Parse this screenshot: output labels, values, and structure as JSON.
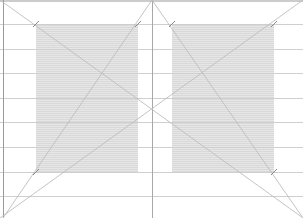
{
  "diagram": {
    "width": 303,
    "height": 218,
    "colors": {
      "background": "#ffffff",
      "text_block": "#e6e6e6",
      "text_block_lines": "#d9d9d9",
      "grid_line": "#cfcfcf",
      "diagonal": "#bdbdbd",
      "spine": "#a8a8a8",
      "edge": "#9a9a9a",
      "tick": "#8a8a8a"
    },
    "page_edges": {
      "left_edge_x": 3,
      "spine_x": 152,
      "top_y": 1
    },
    "horizontal_guides_y": [
      24,
      49,
      73,
      98,
      122,
      147,
      172,
      196
    ],
    "text_blocks": [
      {
        "name": "left-text-block",
        "x": 36,
        "y": 24,
        "w": 102,
        "h": 148
      },
      {
        "name": "right-text-block",
        "x": 172,
        "y": 24,
        "w": 102,
        "h": 148
      }
    ],
    "diagonals": [
      {
        "name": "spread-diagonal-descending",
        "x1": 0,
        "y1": 0,
        "x2": 303,
        "y2": 218
      },
      {
        "name": "spread-diagonal-ascending",
        "x1": 0,
        "y1": 218,
        "x2": 303,
        "y2": 0
      },
      {
        "name": "left-page-diagonal",
        "x1": 152,
        "y1": 0,
        "x2": 3,
        "y2": 218
      },
      {
        "name": "right-page-diagonal",
        "x1": 152,
        "y1": 0,
        "x2": 303,
        "y2": 218
      }
    ],
    "corner_ticks": [
      {
        "name": "tick-left-top-outer",
        "x": 36,
        "y": 24
      },
      {
        "name": "tick-left-top-inner",
        "x": 138,
        "y": 24
      },
      {
        "name": "tick-left-bottom-outer",
        "x": 36,
        "y": 172
      },
      {
        "name": "tick-right-top-inner",
        "x": 172,
        "y": 24
      },
      {
        "name": "tick-right-top-outer",
        "x": 274,
        "y": 24
      },
      {
        "name": "tick-right-bottom-outer",
        "x": 274,
        "y": 172
      }
    ]
  }
}
